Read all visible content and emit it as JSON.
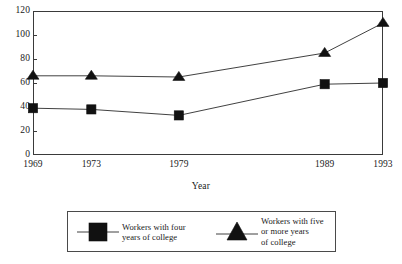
{
  "chart_data": {
    "type": "line",
    "title": "",
    "xlabel": "Year",
    "ylabel": "",
    "x": [
      1969,
      1973,
      1979,
      1989,
      1993
    ],
    "categories": [
      "1969",
      "1973",
      "1979",
      "1989",
      "1993"
    ],
    "xlim": [
      1969,
      1993
    ],
    "ylim": [
      0,
      120
    ],
    "yticks": [
      0,
      20,
      40,
      60,
      80,
      100,
      120
    ],
    "ytick_labels": [
      "0",
      "20",
      "40",
      "60",
      "80",
      "100",
      "120"
    ],
    "xtick_labels": [
      "1969",
      "1973",
      "1979",
      "1989",
      "1993"
    ],
    "grid": false,
    "legend_position": "bottom",
    "series": [
      {
        "name": "Workers with four\nyears of college",
        "marker": "square",
        "color": "#111111",
        "values": [
          39,
          38,
          33,
          59,
          60
        ]
      },
      {
        "name": "Workers with five\nor more years\nof college",
        "marker": "triangle",
        "color": "#111111",
        "values": [
          66,
          66,
          65,
          85,
          110
        ]
      }
    ]
  },
  "axes": {
    "x_title": "Year"
  },
  "legend": {
    "entries": [
      {
        "label": "Workers with four\nyears of college",
        "marker": "square-marker-icon"
      },
      {
        "label": "Workers with five\nor more years\nof college",
        "marker": "triangle-marker-icon"
      }
    ]
  },
  "title_remnant": ""
}
